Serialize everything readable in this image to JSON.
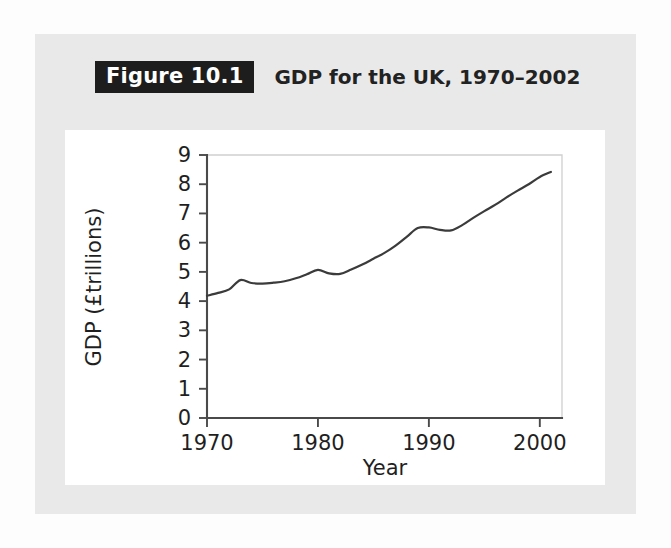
{
  "figure": {
    "badge_label": "Figure 10.1",
    "title": "GDP for the UK, 1970–2002",
    "badge_bg": "#1d1d1d",
    "badge_fg": "#ffffff",
    "card_bg": "#e9e9e9",
    "panel_bg": "#ffffff"
  },
  "chart_data": {
    "type": "line",
    "title": "GDP for the UK, 1970–2002",
    "xlabel": "Year",
    "ylabel": "GDP (£trillions)",
    "xlim": [
      1970,
      2002
    ],
    "ylim": [
      0,
      9
    ],
    "xticks": [
      1970,
      1980,
      1990,
      2000
    ],
    "xtick_labels": [
      "1970",
      "1980",
      "1990",
      "2000"
    ],
    "yticks": [
      0,
      1,
      2,
      3,
      4,
      5,
      6,
      7,
      8,
      9
    ],
    "ytick_labels": [
      "0",
      "1",
      "2",
      "3",
      "4",
      "5",
      "6",
      "7",
      "8",
      "9"
    ],
    "grid": false,
    "legend": null,
    "line_color": "#3b3b3b",
    "series": [
      {
        "name": "GDP (£trillions)",
        "x": [
          1970,
          1971,
          1972,
          1973,
          1974,
          1975,
          1976,
          1977,
          1978,
          1979,
          1980,
          1981,
          1982,
          1983,
          1984,
          1985,
          1986,
          1987,
          1988,
          1989,
          1990,
          1991,
          1992,
          1993,
          1994,
          1995,
          1996,
          1997,
          1998,
          1999,
          2000,
          2001
        ],
        "values": [
          4.18,
          4.28,
          4.4,
          4.72,
          4.62,
          4.6,
          4.63,
          4.68,
          4.78,
          4.92,
          5.07,
          4.95,
          4.93,
          5.08,
          5.25,
          5.45,
          5.65,
          5.9,
          6.2,
          6.5,
          6.52,
          6.44,
          6.42,
          6.6,
          6.85,
          7.08,
          7.3,
          7.55,
          7.78,
          8.0,
          8.25,
          8.42
        ]
      }
    ]
  }
}
